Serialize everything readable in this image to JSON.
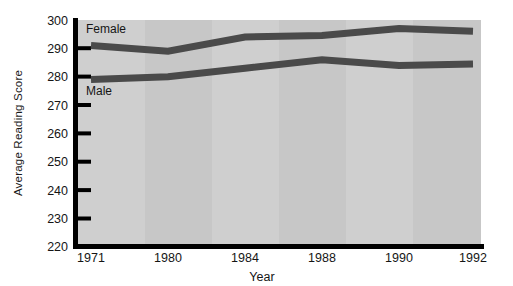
{
  "chart_data": {
    "type": "line",
    "title": "",
    "xlabel": "Year",
    "ylabel": "Average Reading Score",
    "categories": [
      "1971",
      "1980",
      "1984",
      "1988",
      "1990",
      "1992"
    ],
    "x": [
      1971,
      1980,
      1984,
      1988,
      1990,
      1992
    ],
    "ylim": [
      220,
      300
    ],
    "yticks": [
      220,
      230,
      240,
      250,
      260,
      270,
      280,
      290,
      300
    ],
    "ytick_labels": [
      "220",
      "230",
      "240",
      "250",
      "260",
      "270",
      "280",
      "290",
      "300"
    ],
    "grid": false,
    "legend": "inline-labels",
    "series": [
      {
        "name": "Female",
        "values": [
          291,
          289,
          294,
          294.5,
          297,
          296
        ],
        "color": "#4a4a4a",
        "label_text": "Female"
      },
      {
        "name": "Male",
        "values": [
          279,
          280,
          283,
          286,
          284,
          284.5
        ],
        "color": "#4a4a4a",
        "label_text": "Male"
      }
    ],
    "plot_background": "#cfcfcf",
    "band_background": "#c6c6c6",
    "axis_color": "#000000"
  },
  "axes": {
    "y_title": "Average Reading Score",
    "x_title": "Year"
  },
  "labels": {
    "female": "Female",
    "male": "Male"
  }
}
